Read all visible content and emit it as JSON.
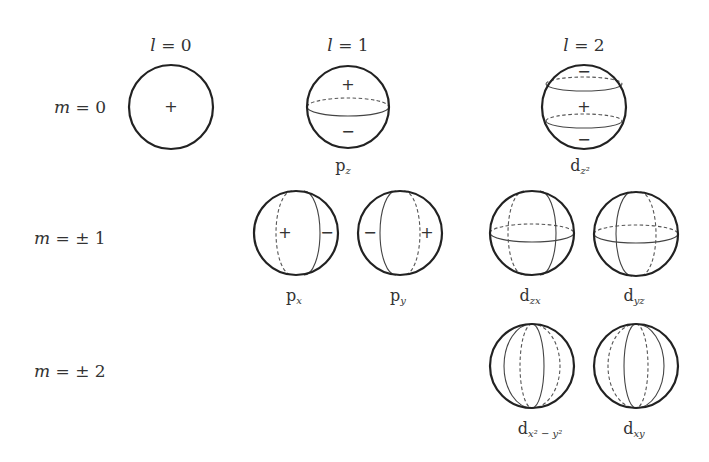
{
  "headers": {
    "l0": "l = 0",
    "l1": "l = 1",
    "l2": "l = 2"
  },
  "rows": {
    "m0": "m = 0",
    "m1": "m = ± 1",
    "m2": "m = ± 2"
  },
  "orbitals": [
    {
      "id": "s",
      "label": "",
      "sub": "",
      "signs": [
        "+"
      ]
    },
    {
      "id": "pz",
      "label": "p",
      "sub": "z",
      "signs": [
        "+",
        "−"
      ]
    },
    {
      "id": "dz2",
      "label": "d",
      "sub": "z²",
      "signs": [
        "−",
        "+",
        "−"
      ]
    },
    {
      "id": "px",
      "label": "p",
      "sub": "x",
      "signs": [
        "+",
        "−"
      ]
    },
    {
      "id": "py",
      "label": "p",
      "sub": "y",
      "signs": [
        "−",
        "+"
      ]
    },
    {
      "id": "dzx",
      "label": "d",
      "sub": "zx",
      "signs": []
    },
    {
      "id": "dyz",
      "label": "d",
      "sub": "yz",
      "signs": []
    },
    {
      "id": "dx2y2",
      "label": "d",
      "sub": "x² − y²",
      "signs": []
    },
    {
      "id": "dxy",
      "label": "d",
      "sub": "xy",
      "signs": []
    }
  ],
  "colors": {
    "outline": "#222222",
    "text": "#333333",
    "background": "#ffffff"
  }
}
